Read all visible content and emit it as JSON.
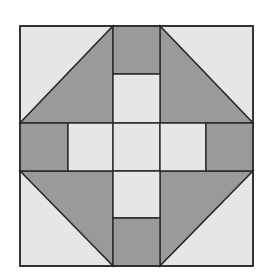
{
  "diagram": {
    "type": "quilt-block",
    "origin": {
      "x": 20,
      "y": 26
    },
    "size": {
      "width": 233,
      "height": 240
    },
    "colors": {
      "background": "#ffffff",
      "dark": "#9a9a9a",
      "light": "#e6e6e6",
      "outline": "#2a2a2a"
    },
    "grid": {
      "columns": [
        0,
        48,
        93,
        140,
        186,
        233
      ],
      "rows": [
        0,
        48,
        97,
        145,
        192,
        240
      ]
    },
    "pieces": [
      {
        "name": "corner-top-left-light",
        "shape": "triangle",
        "fill": "light",
        "points": "0,0 93,0 0,97"
      },
      {
        "name": "corner-top-left-dark",
        "shape": "triangle",
        "fill": "dark",
        "points": "93,0 93,97 0,97"
      },
      {
        "name": "corner-top-right-light",
        "shape": "triangle",
        "fill": "light",
        "points": "140,0 233,0 233,97"
      },
      {
        "name": "corner-top-right-dark",
        "shape": "triangle",
        "fill": "dark",
        "points": "140,0 233,97 140,97"
      },
      {
        "name": "corner-bottom-left-dark",
        "shape": "triangle",
        "fill": "dark",
        "points": "0,145 93,145 93,240"
      },
      {
        "name": "corner-bottom-left-light",
        "shape": "triangle",
        "fill": "light",
        "points": "0,145 93,240 0,240"
      },
      {
        "name": "corner-bottom-right-dark",
        "shape": "triangle",
        "fill": "dark",
        "points": "140,145 233,145 140,240"
      },
      {
        "name": "corner-bottom-right-light",
        "shape": "triangle",
        "fill": "light",
        "points": "233,145 233,240 140,240"
      },
      {
        "name": "top-arm-outer",
        "shape": "rect",
        "fill": "dark",
        "points": "93,0 140,0 140,48 93,48"
      },
      {
        "name": "top-arm-inner",
        "shape": "rect",
        "fill": "light",
        "points": "93,48 140,48 140,97 93,97"
      },
      {
        "name": "left-arm-outer",
        "shape": "rect",
        "fill": "dark",
        "points": "0,97 48,97 48,145 0,145"
      },
      {
        "name": "left-arm-inner",
        "shape": "rect",
        "fill": "light",
        "points": "48,97 93,97 93,145 48,145"
      },
      {
        "name": "center-square",
        "shape": "rect",
        "fill": "light",
        "points": "93,97 140,97 140,145 93,145"
      },
      {
        "name": "right-arm-inner",
        "shape": "rect",
        "fill": "light",
        "points": "140,97 186,97 186,145 140,145"
      },
      {
        "name": "right-arm-outer",
        "shape": "rect",
        "fill": "dark",
        "points": "186,97 233,97 233,145 186,145"
      },
      {
        "name": "bottom-arm-inner",
        "shape": "rect",
        "fill": "light",
        "points": "93,145 140,145 140,192 93,192"
      },
      {
        "name": "bottom-arm-outer",
        "shape": "rect",
        "fill": "dark",
        "points": "93,192 140,192 140,240 93,240"
      }
    ]
  }
}
